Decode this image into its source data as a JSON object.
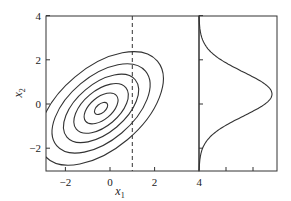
{
  "chart_data": [
    {
      "type": "contour",
      "title": "",
      "xlabel": "x1",
      "ylabel": "x2",
      "xlim": [
        -2.9,
        4
      ],
      "ylim": [
        -3,
        4
      ],
      "xticks": [
        -2,
        0,
        2,
        4
      ],
      "yticks": [
        -2,
        0,
        2,
        4
      ],
      "gaussian": {
        "mean": [
          -0.4,
          -0.2
        ],
        "orientation_deg": 40,
        "note": "bivariate Gaussian, positive correlation"
      },
      "contour_levels": 6,
      "contour_semi_axes": [
        [
          0.35,
          0.2
        ],
        [
          0.9,
          0.5
        ],
        [
          1.45,
          0.8
        ],
        [
          2.0,
          1.1
        ],
        [
          2.6,
          1.45
        ],
        [
          3.3,
          1.85
        ]
      ],
      "vertical_line": {
        "x": 1,
        "style": "dashed"
      }
    },
    {
      "type": "line",
      "title": "",
      "orientation": "horizontal-density",
      "description": "conditional distribution of x2 given x1=1",
      "ylim": [
        -3,
        4
      ],
      "peak_y": 0.45,
      "sigma": 1.0,
      "xtick_label": "4"
    }
  ],
  "labels": {
    "xtick": [
      "-2",
      "0",
      "2",
      "4"
    ],
    "ytick": [
      "4",
      "2",
      "0",
      "-2"
    ],
    "right_xtick": "4",
    "xlabel": "x",
    "xlabel_sub": "1",
    "ylabel": "x",
    "ylabel_sub": "2"
  }
}
